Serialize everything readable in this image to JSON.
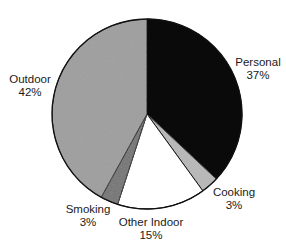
{
  "chart_data": {
    "type": "pie",
    "title": "",
    "start_angle_deg": 0,
    "direction": "clockwise",
    "slices": [
      {
        "label": "Personal",
        "value": 37,
        "display": "37%",
        "color": "#0a0a0a"
      },
      {
        "label": "Cooking",
        "value": 3,
        "display": "3%",
        "color": "#b8b8b8"
      },
      {
        "label": "Other Indoor",
        "value": 15,
        "display": "15%",
        "color": "#ffffff"
      },
      {
        "label": "Smoking",
        "value": 3,
        "display": "3%",
        "color": "#6e6e6e"
      },
      {
        "label": "Outdoor",
        "value": 42,
        "display": "42%",
        "color": "#9c9c9c"
      }
    ],
    "categories": [
      "Personal",
      "Cooking",
      "Other Indoor",
      "Smoking",
      "Outdoor"
    ],
    "values": [
      37,
      3,
      15,
      3,
      42
    ],
    "legend": "none (direct labels)"
  },
  "labels": {
    "personal": {
      "name": "Personal",
      "pct": "37%"
    },
    "cooking": {
      "name": "Cooking",
      "pct": "3%"
    },
    "other_indoor": {
      "name": "Other Indoor",
      "pct": "15%"
    },
    "smoking": {
      "name": "Smoking",
      "pct": "3%"
    },
    "outdoor": {
      "name": "Outdoor",
      "pct": "42%"
    }
  }
}
